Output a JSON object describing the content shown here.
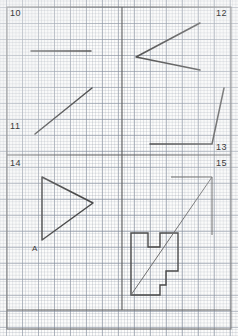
{
  "sheet": {
    "kind": "graph-paper-worksheet",
    "background_color": "#fdfdfc",
    "grid_minor_color": "#969eaa",
    "grid_major_color": "#7a8494",
    "ink_color": "#4a4a4a",
    "width": 238,
    "height": 336
  },
  "labels": {
    "fig10": "10",
    "fig11": "11",
    "fig12": "12",
    "fig13": "13",
    "fig14": "14",
    "fig15": "15",
    "vertex_a": "A"
  },
  "figures": [
    {
      "id": "fig10",
      "label": "10",
      "quadrant": "top-left",
      "shape": "horizontal-segment",
      "points": [
        [
          31,
          51
        ],
        [
          91,
          51
        ]
      ]
    },
    {
      "id": "fig11",
      "label": "11",
      "quadrant": "mid-left",
      "shape": "diagonal-segment",
      "points": [
        [
          35,
          134
        ],
        [
          92,
          88
        ]
      ]
    },
    {
      "id": "fig12",
      "label": "12",
      "quadrant": "top-right",
      "shape": "chevron-open-right",
      "points": [
        [
          200,
          23
        ],
        [
          136,
          57
        ],
        [
          200,
          70
        ]
      ]
    },
    {
      "id": "fig13",
      "label": "13",
      "quadrant": "mid-right",
      "shape": "bent-line",
      "points": [
        [
          150,
          144
        ],
        [
          212,
          144
        ],
        [
          224,
          88
        ]
      ]
    },
    {
      "id": "fig14",
      "label": "14",
      "quadrant": "bottom-left",
      "shape": "triangle-pointing-right",
      "points": [
        [
          42,
          177
        ],
        [
          93,
          203
        ],
        [
          42,
          240
        ]
      ],
      "vertex_label": "A",
      "vertex_label_at": [
        42,
        240
      ]
    },
    {
      "id": "fig15",
      "label": "15",
      "quadrant": "bottom-right",
      "shape": "stepped-polygon-with-diagonal",
      "polygon": [
        [
          131,
          233
        ],
        [
          148,
          233
        ],
        [
          148,
          247
        ],
        [
          160,
          247
        ],
        [
          160,
          233
        ],
        [
          178,
          233
        ],
        [
          178,
          271
        ],
        [
          166,
          271
        ],
        [
          166,
          285
        ],
        [
          160,
          285
        ],
        [
          160,
          295
        ],
        [
          131,
          295
        ]
      ],
      "diagonal": [
        [
          131,
          295
        ],
        [
          212,
          177
        ]
      ],
      "horizontal_guide": [
        [
          171,
          177
        ],
        [
          212,
          177
        ]
      ],
      "vertical_guide": [
        [
          212,
          177
        ],
        [
          212,
          235
        ]
      ]
    }
  ],
  "axes": {
    "vertical_axis_x": 122,
    "vertical_axis_top": 7,
    "vertical_axis_bottom": 310,
    "horizontal_divider_y": 155,
    "horizontal_divider_left": 7,
    "horizontal_divider_right": 231
  },
  "bottom_band": {
    "top": 310,
    "bottom": 329,
    "left": 7,
    "right": 231
  },
  "border": {
    "left": 7,
    "top": 7,
    "right": 231,
    "bottom": 329
  }
}
